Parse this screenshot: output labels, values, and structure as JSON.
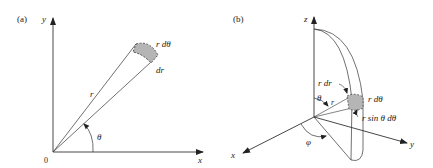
{
  "panel_a": {
    "label": "(a)",
    "axis_y": "y",
    "axis_x": "x",
    "origin": "0",
    "radius": "r",
    "angle": "θ",
    "arc_element": "r dθ",
    "radial_element": "dr"
  },
  "panel_b": {
    "label": "(b)",
    "axis_z": "z",
    "axis_y": "y",
    "axis_x": "x",
    "radius": "r",
    "polar_angle": "θ",
    "azimuth_angle": "φ",
    "radial_element": "r dr",
    "polar_element": "r dθ",
    "azimuth_element": "r sin θ dθ"
  },
  "colors": {
    "line": "#333333",
    "patch": "#b5b5b5"
  }
}
